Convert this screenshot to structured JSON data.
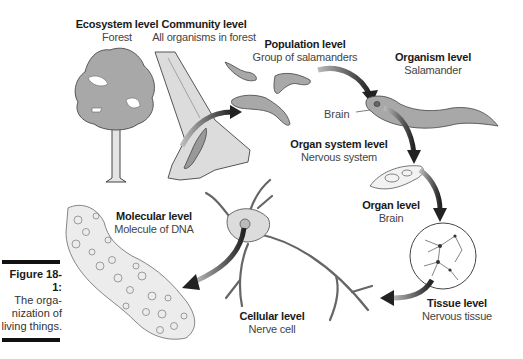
{
  "figure": {
    "number": "Figure 18-1:",
    "caption_lines": [
      "The orga-",
      "nization of",
      "living things."
    ]
  },
  "levels": [
    {
      "id": "ecosystem",
      "title": "Ecosystem level",
      "subtitle": "Forest"
    },
    {
      "id": "community",
      "title": "Community level",
      "subtitle": "All organisms in forest"
    },
    {
      "id": "population",
      "title": "Population level",
      "subtitle": "Group of salamanders"
    },
    {
      "id": "organism",
      "title": "Organism level",
      "subtitle": "Salamander"
    },
    {
      "id": "organ_system",
      "title": "Organ system level",
      "subtitle": "Nervous system"
    },
    {
      "id": "organ",
      "title": "Organ level",
      "subtitle": "Brain"
    },
    {
      "id": "tissue",
      "title": "Tissue level",
      "subtitle": "Nervous tissue"
    },
    {
      "id": "cellular",
      "title": "Cellular level",
      "subtitle": "Nerve cell"
    },
    {
      "id": "molecular",
      "title": "Molecular level",
      "subtitle": "Molecule of DNA"
    }
  ],
  "annotations": {
    "brain_pointer": "Brain"
  },
  "colors": {
    "fill_gray": "#a8a8a8",
    "fill_light": "#d9d9d9",
    "outline": "#333333",
    "arrow": "#2a2a2a"
  }
}
